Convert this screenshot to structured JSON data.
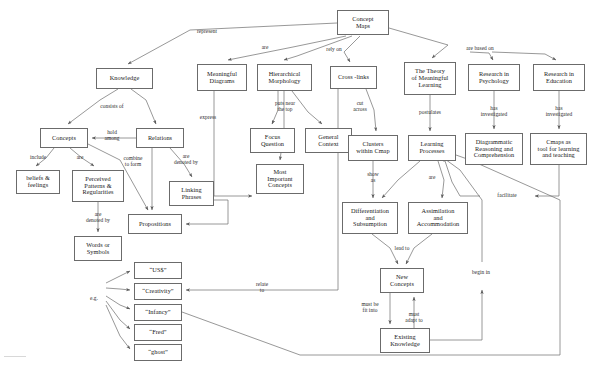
{
  "diagram": {
    "title": "Concept Maps",
    "kind": "concept-map",
    "canvas": {
      "width": 592,
      "height": 368,
      "background": "#ffffff"
    },
    "style": {
      "node_fill": "#ffffff",
      "node_border": "#6b6b6b",
      "edge_color": "#707070",
      "text_color": "#181818",
      "label_color": "#2b2b2b"
    }
  },
  "nodes": [
    {
      "id": "concept_maps",
      "label": "Concept\nMaps",
      "x": 337,
      "y": 10,
      "w": 52,
      "h": 25
    },
    {
      "id": "knowledge",
      "label": "Knowledge",
      "x": 96,
      "y": 68,
      "w": 57,
      "h": 21
    },
    {
      "id": "meaningful_diagrams",
      "label": "Meaningful\nDiagrams",
      "x": 197,
      "y": 64,
      "w": 50,
      "h": 27
    },
    {
      "id": "hierarchical_morph",
      "label": "Hierarchical\nMorphology",
      "x": 257,
      "y": 64,
      "w": 55,
      "h": 27
    },
    {
      "id": "cross_links",
      "label": "Cross -links",
      "x": 330,
      "y": 66,
      "w": 47,
      "h": 23
    },
    {
      "id": "theory_meaningful",
      "label": "The Theory\nof Meaningful\nLearning",
      "x": 404,
      "y": 62,
      "w": 52,
      "h": 33
    },
    {
      "id": "research_psych",
      "label": "Research in\nPsychology",
      "x": 468,
      "y": 64,
      "w": 52,
      "h": 27
    },
    {
      "id": "research_edu",
      "label": "Research in\nEducation",
      "x": 533,
      "y": 64,
      "w": 52,
      "h": 27
    },
    {
      "id": "concepts",
      "label": "Concepts",
      "x": 40,
      "y": 128,
      "w": 48,
      "h": 20
    },
    {
      "id": "relations",
      "label": "Relations",
      "x": 136,
      "y": 128,
      "w": 48,
      "h": 20
    },
    {
      "id": "focus_question",
      "label": "Focus\nQuestion",
      "x": 250,
      "y": 128,
      "w": 45,
      "h": 25
    },
    {
      "id": "general_context",
      "label": "General\nContext",
      "x": 305,
      "y": 128,
      "w": 47,
      "h": 25
    },
    {
      "id": "clusters_cmap",
      "label": "Clusters\nwithin Cmap",
      "x": 348,
      "y": 135,
      "w": 50,
      "h": 26
    },
    {
      "id": "learning_processes",
      "label": "Learning\nProcesses",
      "x": 408,
      "y": 135,
      "w": 48,
      "h": 26
    },
    {
      "id": "diagrammatic",
      "label": "Diagrammatic\nReasoning and\nComprehension",
      "x": 465,
      "y": 133,
      "w": 58,
      "h": 32
    },
    {
      "id": "cmaps_tool",
      "label": "Cmaps as\ntool for learning\nand teaching",
      "x": 530,
      "y": 133,
      "w": 57,
      "h": 32
    },
    {
      "id": "beliefs_feelings",
      "label": "beliefs &\nfeelings",
      "x": 16,
      "y": 170,
      "w": 44,
      "h": 24
    },
    {
      "id": "perceived_patterns",
      "label": "Perceived\nPatterns &\nRegularities",
      "x": 72,
      "y": 170,
      "w": 52,
      "h": 32
    },
    {
      "id": "linking_phrases",
      "label": "Linking\nPhrases",
      "x": 169,
      "y": 181,
      "w": 45,
      "h": 25
    },
    {
      "id": "propositions",
      "label": "Propositions",
      "x": 128,
      "y": 214,
      "w": 54,
      "h": 20
    },
    {
      "id": "most_important",
      "label": "Most\nImportant\nConcepts",
      "x": 256,
      "y": 164,
      "w": 48,
      "h": 30
    },
    {
      "id": "differentiation",
      "label": "Differentiation\nand\nSubsumption",
      "x": 342,
      "y": 202,
      "w": 56,
      "h": 32
    },
    {
      "id": "assimilation",
      "label": "Assimilation\nand\nAccommodation",
      "x": 408,
      "y": 202,
      "w": 60,
      "h": 32
    },
    {
      "id": "words_symbols",
      "label": "Words or\nSymbols",
      "x": 74,
      "y": 236,
      "w": 48,
      "h": 25
    },
    {
      "id": "new_concepts",
      "label": "New\nConcepts",
      "x": 380,
      "y": 268,
      "w": 44,
      "h": 25
    },
    {
      "id": "existing_knowledge",
      "label": "Existing\nKnowledge",
      "x": 380,
      "y": 328,
      "w": 50,
      "h": 25
    },
    {
      "id": "ex_uss",
      "label": "“US$”",
      "x": 134,
      "y": 262,
      "w": 48,
      "h": 17
    },
    {
      "id": "ex_creativity",
      "label": "“Creativity”",
      "x": 134,
      "y": 283,
      "w": 48,
      "h": 17
    },
    {
      "id": "ex_infancy",
      "label": "“Infancy”",
      "x": 134,
      "y": 304,
      "w": 48,
      "h": 17
    },
    {
      "id": "ex_fred",
      "label": "“Fred”",
      "x": 134,
      "y": 324,
      "w": 48,
      "h": 17
    },
    {
      "id": "ex_ghost",
      "label": "“ghost”",
      "x": 134,
      "y": 344,
      "w": 48,
      "h": 17
    }
  ],
  "edge_labels": [
    {
      "id": "represent",
      "text": "represent",
      "x": 207,
      "y": 32
    },
    {
      "id": "are_top",
      "text": "are",
      "x": 265,
      "y": 48
    },
    {
      "id": "rely_on",
      "text": "rely on",
      "x": 334,
      "y": 50
    },
    {
      "id": "are_based_on",
      "text": "are based on",
      "x": 480,
      "y": 49
    },
    {
      "id": "consists_of",
      "text": "consists of",
      "x": 112,
      "y": 107
    },
    {
      "id": "hold_among",
      "text": "hold\namong",
      "x": 112,
      "y": 136
    },
    {
      "id": "puts_near_top",
      "text": "puts near\nthe top",
      "x": 285,
      "y": 107
    },
    {
      "id": "express",
      "text": "express",
      "x": 208,
      "y": 118
    },
    {
      "id": "cut_across",
      "text": "cut\nacross",
      "x": 360,
      "y": 107
    },
    {
      "id": "postulates",
      "text": "postulates",
      "x": 430,
      "y": 113
    },
    {
      "id": "has_investigated_psy",
      "text": "has\ninvestigated",
      "x": 494,
      "y": 112
    },
    {
      "id": "has_investigated_edu",
      "text": "has\ninvestigated",
      "x": 559,
      "y": 112
    },
    {
      "id": "include",
      "text": "include",
      "x": 38,
      "y": 158
    },
    {
      "id": "are_concepts",
      "text": "are",
      "x": 80,
      "y": 158
    },
    {
      "id": "combine_to_form",
      "text": "combine\nto form",
      "x": 133,
      "y": 162
    },
    {
      "id": "are_denoted_by_rel",
      "text": "are\ndenoted by",
      "x": 186,
      "y": 160
    },
    {
      "id": "show_as",
      "text": "show\nas",
      "x": 373,
      "y": 178
    },
    {
      "id": "are_learning",
      "text": "are",
      "x": 432,
      "y": 178
    },
    {
      "id": "are_denoted_by_pp",
      "text": "are\ndenoted by",
      "x": 98,
      "y": 218
    },
    {
      "id": "facilitate",
      "text": "facilitate",
      "x": 507,
      "y": 196
    },
    {
      "id": "lead_to",
      "text": "lead to",
      "x": 402,
      "y": 249
    },
    {
      "id": "eg",
      "text": "e.g.",
      "x": 94,
      "y": 299
    },
    {
      "id": "relate_to",
      "text": "relate\nto",
      "x": 262,
      "y": 288
    },
    {
      "id": "begin_in",
      "text": "begin in",
      "x": 481,
      "y": 273
    },
    {
      "id": "must_be_fit_into",
      "text": "must be\nfit into",
      "x": 370,
      "y": 308
    },
    {
      "id": "must_adapt_to",
      "text": "must\nadapt to",
      "x": 414,
      "y": 318
    }
  ],
  "edges": [
    {
      "from": "concept_maps",
      "to": "knowledge",
      "label": "represent"
    },
    {
      "from": "concept_maps",
      "to": "meaningful_diagrams",
      "label": "are"
    },
    {
      "from": "concept_maps",
      "to": "hierarchical_morph",
      "label": "are"
    },
    {
      "from": "concept_maps",
      "to": "cross_links",
      "label": "rely on"
    },
    {
      "from": "concept_maps",
      "to": "theory_meaningful",
      "label": "are based on"
    },
    {
      "from": "concept_maps",
      "to": "research_psych",
      "label": "are based on"
    },
    {
      "from": "concept_maps",
      "to": "research_edu",
      "label": "are based on"
    },
    {
      "from": "knowledge",
      "to": "concepts",
      "label": "consists of"
    },
    {
      "from": "knowledge",
      "to": "relations",
      "label": "consists of"
    },
    {
      "from": "relations",
      "to": "concepts",
      "label": "hold among"
    },
    {
      "from": "concepts",
      "to": "beliefs_feelings",
      "label": "include"
    },
    {
      "from": "concepts",
      "to": "perceived_patterns",
      "label": "are"
    },
    {
      "from": "concepts",
      "to": "propositions",
      "label": "combine to form"
    },
    {
      "from": "relations",
      "to": "propositions",
      "label": "combine to form"
    },
    {
      "from": "relations",
      "to": "linking_phrases",
      "label": "are denoted by"
    },
    {
      "from": "linking_phrases",
      "to": "propositions",
      "label": ""
    },
    {
      "from": "perceived_patterns",
      "to": "words_symbols",
      "label": "are denoted by"
    },
    {
      "from": "words_symbols",
      "to": "ex_uss",
      "label": "e.g."
    },
    {
      "from": "words_symbols",
      "to": "ex_creativity",
      "label": "e.g."
    },
    {
      "from": "words_symbols",
      "to": "ex_infancy",
      "label": "e.g."
    },
    {
      "from": "words_symbols",
      "to": "ex_fred",
      "label": "e.g."
    },
    {
      "from": "words_symbols",
      "to": "ex_ghost",
      "label": "e.g."
    },
    {
      "from": "meaningful_diagrams",
      "to": "most_important",
      "label": "express"
    },
    {
      "from": "hierarchical_morph",
      "to": "focus_question",
      "label": "puts near the top"
    },
    {
      "from": "hierarchical_morph",
      "to": "general_context",
      "label": "puts near the top"
    },
    {
      "from": "hierarchical_morph",
      "to": "most_important",
      "label": "puts near the top"
    },
    {
      "from": "cross_links",
      "to": "clusters_cmap",
      "label": "cut across"
    },
    {
      "from": "cross_links",
      "to": "ex_creativity",
      "label": "relate to"
    },
    {
      "from": "theory_meaningful",
      "to": "learning_processes",
      "label": "postulates"
    },
    {
      "from": "research_psych",
      "to": "diagrammatic",
      "label": "has investigated"
    },
    {
      "from": "research_edu",
      "to": "cmaps_tool",
      "label": "has investigated"
    },
    {
      "from": "clusters_cmap",
      "to": "differentiation",
      "label": "show as"
    },
    {
      "from": "learning_processes",
      "to": "differentiation",
      "label": "are"
    },
    {
      "from": "learning_processes",
      "to": "assimilation",
      "label": "are"
    },
    {
      "from": "differentiation",
      "to": "new_concepts",
      "label": "lead to"
    },
    {
      "from": "assimilation",
      "to": "new_concepts",
      "label": "lead to"
    },
    {
      "from": "new_concepts",
      "to": "existing_knowledge",
      "label": "must be fit into"
    },
    {
      "from": "existing_knowledge",
      "to": "new_concepts",
      "label": "must adapt to"
    },
    {
      "from": "existing_knowledge",
      "to": "learning_processes",
      "label": "begin in"
    },
    {
      "from": "cmaps_tool",
      "to": "learning_processes",
      "label": "facilitate"
    },
    {
      "from": "ex_infancy",
      "to": "existing_knowledge",
      "label": ""
    }
  ]
}
